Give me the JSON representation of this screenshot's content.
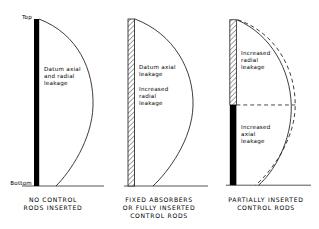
{
  "figure": {
    "title": "",
    "axis_labels": {
      "top": "Top",
      "bottom": "Bottom"
    },
    "colors": {
      "line": "#1a1a1a",
      "rod_inserted_fill": "#000000",
      "rod_absorber_fill": "#ffffff",
      "background": "#ffffff"
    }
  },
  "panels": [
    {
      "id": "no-control-rods",
      "caption": "NO CONTROL\nRODS INSERTED",
      "annotation": "Datum axial\nand radial\nleakage",
      "rod": {
        "style": "solid-black",
        "top_fraction": 0.0,
        "bottom_fraction": 1.0,
        "inserted": false
      },
      "curves": [
        {
          "name": "flux-datum",
          "style": "solid",
          "peak_offset_px": 62
        }
      ],
      "edge_label_top": "Top",
      "edge_label_bottom": "Bottom"
    },
    {
      "id": "fixed-absorbers",
      "caption": "FIXED ABSORBERS\nOR FULLY INSERTED\nCONTROL RODS",
      "annotation": "Datum axial\nleakage",
      "annotation_2": "Increased\nradial\nleakage",
      "rod": {
        "style": "hatched",
        "top_fraction": 0.0,
        "bottom_fraction": 1.0,
        "inserted": true
      },
      "curves": [
        {
          "name": "flux-depressed",
          "style": "solid",
          "peak_offset_px": 62
        }
      ]
    },
    {
      "id": "partially-inserted",
      "caption": "PARTIALLY INSERTED\nCONTROL RODS",
      "annotation": "Increased\nradial\nleakage",
      "annotation_2": "Increased\naxial\nleakage",
      "rod": {
        "style": "hatched-over-solid",
        "split_fraction": 0.52,
        "inserted": true
      },
      "curves": [
        {
          "name": "flux-solid",
          "style": "solid",
          "peak_offset_px": 60
        },
        {
          "name": "flux-dashed-reference",
          "style": "dashed",
          "peak_offset_px": 64
        }
      ],
      "divider": {
        "style": "dashed",
        "orientation": "horizontal"
      }
    }
  ]
}
